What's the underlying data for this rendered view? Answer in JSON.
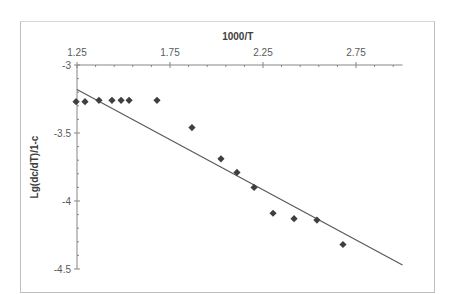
{
  "chart_data": {
    "type": "scatter",
    "title": "",
    "xlabel": "1000/T",
    "ylabel": "Lg(dc/dT)/1-c",
    "xlim": [
      1.25,
      3.0
    ],
    "ylim": [
      -4.5,
      -3
    ],
    "x_ticks": [
      "1.25",
      "1.75",
      "2.25",
      "2.75"
    ],
    "y_ticks": [
      "-3",
      "-3.5",
      "-4",
      "-4.5"
    ],
    "x_axis_position": "top",
    "grid": false,
    "legend": null,
    "series": [
      {
        "name": "data",
        "marker": "diamond",
        "color": "#3f3f3f",
        "x": [
          1.245,
          1.293,
          1.368,
          1.438,
          1.487,
          1.53,
          1.68,
          1.868,
          2.024,
          2.11,
          2.202,
          2.304,
          2.417,
          2.54,
          2.68
        ],
        "y": [
          -3.27,
          -3.27,
          -3.26,
          -3.26,
          -3.26,
          -3.26,
          -3.26,
          -3.46,
          -3.69,
          -3.79,
          -3.9,
          -4.09,
          -4.13,
          -4.14,
          -4.32
        ]
      },
      {
        "name": "linear trendline",
        "type": "line",
        "color": "#595959",
        "x": [
          1.25,
          3.0
        ],
        "y": [
          -3.18,
          -4.47
        ]
      }
    ]
  }
}
